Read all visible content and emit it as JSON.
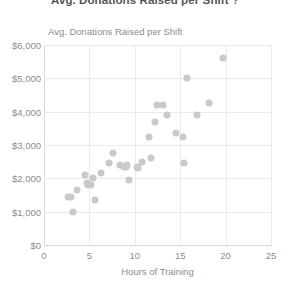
{
  "chart_data": {
    "type": "scatter",
    "title": "Avg. Donations Raised per Shift",
    "title_suffix_icon": "?",
    "inline_y_label": "Avg. Donations Raised per Shift",
    "xlabel": "Hours of Training",
    "ylabel": "",
    "xlim": [
      0,
      25
    ],
    "ylim": [
      0,
      6000
    ],
    "xticks": [
      0,
      5,
      10,
      15,
      20,
      25
    ],
    "xtick_labels": [
      "0",
      "5",
      "10",
      "15",
      "20",
      "25"
    ],
    "yticks": [
      0,
      1000,
      2000,
      3000,
      4000,
      5000,
      6000
    ],
    "ytick_labels": [
      "$0",
      "$1,000",
      "$2,000",
      "$3,000",
      "$4,000",
      "$5,000",
      "$6,000"
    ],
    "grid": true,
    "legend": "none",
    "point_color": "#c9c9c9",
    "series": [
      {
        "name": "Volunteers",
        "points": [
          {
            "x": 2.6,
            "y": 1450
          },
          {
            "x": 3.0,
            "y": 1450
          },
          {
            "x": 3.2,
            "y": 1000
          },
          {
            "x": 3.6,
            "y": 1650
          },
          {
            "x": 4.5,
            "y": 2100
          },
          {
            "x": 4.7,
            "y": 1850
          },
          {
            "x": 4.9,
            "y": 1800
          },
          {
            "x": 5.2,
            "y": 1800
          },
          {
            "x": 5.4,
            "y": 2000
          },
          {
            "x": 5.6,
            "y": 1350
          },
          {
            "x": 6.3,
            "y": 2150
          },
          {
            "x": 7.2,
            "y": 2450
          },
          {
            "x": 7.6,
            "y": 2750
          },
          {
            "x": 8.4,
            "y": 2400
          },
          {
            "x": 8.8,
            "y": 2350
          },
          {
            "x": 9.0,
            "y": 2350
          },
          {
            "x": 9.1,
            "y": 2400
          },
          {
            "x": 9.4,
            "y": 1950
          },
          {
            "x": 10.2,
            "y": 2350
          },
          {
            "x": 10.4,
            "y": 2300
          },
          {
            "x": 10.8,
            "y": 2500
          },
          {
            "x": 11.8,
            "y": 2600
          },
          {
            "x": 11.6,
            "y": 3250
          },
          {
            "x": 12.2,
            "y": 3700
          },
          {
            "x": 12.4,
            "y": 4200
          },
          {
            "x": 13.1,
            "y": 4200
          },
          {
            "x": 13.6,
            "y": 3900
          },
          {
            "x": 14.5,
            "y": 3350
          },
          {
            "x": 15.3,
            "y": 3250
          },
          {
            "x": 15.4,
            "y": 2450
          },
          {
            "x": 15.7,
            "y": 5000
          },
          {
            "x": 16.8,
            "y": 3900
          },
          {
            "x": 18.2,
            "y": 4250
          },
          {
            "x": 19.7,
            "y": 5600
          }
        ]
      }
    ]
  }
}
